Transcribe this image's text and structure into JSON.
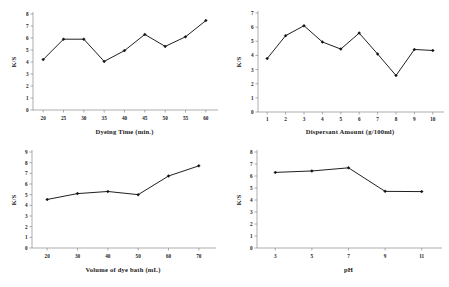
{
  "figure": {
    "name": "four-panel-dyeing-parameter-line-charts",
    "background_color": "#ffffff",
    "line_color": "#141414",
    "marker_color": "#111111",
    "axis_color": "#8a8a8a",
    "text_color": "#1a1a1a"
  },
  "chart_data": [
    {
      "id": "dyeing-time",
      "type": "line",
      "title": "",
      "xlabel": "Dyeing Time (min.)",
      "ylabel": "K/S",
      "x": [
        20,
        25,
        30,
        35,
        40,
        45,
        50,
        55,
        60
      ],
      "values": [
        4.2,
        5.9,
        5.9,
        4.05,
        4.95,
        6.3,
        5.3,
        6.1,
        7.45
      ],
      "xticks": [
        "20",
        "25",
        "30",
        "35",
        "40",
        "45",
        "50",
        "55",
        "60"
      ],
      "yticks": [
        "0",
        "1",
        "2",
        "3",
        "4",
        "5",
        "6",
        "7",
        "8"
      ],
      "xlim": [
        17.5,
        62.5
      ],
      "ylim": [
        0,
        8
      ],
      "grid": false,
      "legend": "none",
      "marker": "diamond"
    },
    {
      "id": "dispersant-amount",
      "type": "line",
      "title": "",
      "xlabel": "Dispersant Amount (g/100ml)",
      "ylabel": "K/S",
      "x": [
        1,
        2,
        3,
        4,
        5,
        6,
        7,
        8,
        9,
        10
      ],
      "values": [
        3.78,
        5.4,
        6.1,
        4.95,
        4.45,
        5.58,
        4.1,
        2.58,
        4.42,
        4.35
      ],
      "xticks": [
        "1",
        "2",
        "3",
        "4",
        "5",
        "6",
        "7",
        "8",
        "9",
        "10"
      ],
      "yticks": [
        "0",
        "1",
        "2",
        "3",
        "4",
        "5",
        "6",
        "7"
      ],
      "xlim": [
        0.5,
        10.5
      ],
      "ylim": [
        0,
        7
      ],
      "grid": false,
      "legend": "none",
      "marker": "diamond"
    },
    {
      "id": "volume-of-dye-bath",
      "type": "line",
      "title": "",
      "xlabel": "Volume  of dye bath  (mL)",
      "ylabel": "K/S",
      "x": [
        20,
        30,
        40,
        50,
        60,
        70
      ],
      "values": [
        4.55,
        5.1,
        5.3,
        5.0,
        6.75,
        7.7
      ],
      "xticks": [
        "20",
        "30",
        "40",
        "50",
        "60",
        "70"
      ],
      "yticks": [
        "0",
        "1",
        "2",
        "3",
        "4",
        "5",
        "6",
        "7",
        "8",
        "9"
      ],
      "xlim": [
        15,
        75
      ],
      "ylim": [
        0,
        9
      ],
      "grid": false,
      "legend": "none",
      "marker": "diamond"
    },
    {
      "id": "ph",
      "type": "line",
      "title": "",
      "xlabel": "pH",
      "ylabel": "K/S",
      "x": [
        3,
        5,
        7,
        9,
        11
      ],
      "values": [
        6.3,
        6.42,
        6.68,
        4.72,
        4.7
      ],
      "xticks": [
        "3",
        "5",
        "7",
        "9",
        "11"
      ],
      "yticks": [
        "0",
        "1",
        "2",
        "3",
        "4",
        "5",
        "6",
        "7",
        "8"
      ],
      "xlim": [
        2,
        12
      ],
      "ylim": [
        0,
        8
      ],
      "grid": false,
      "legend": "none",
      "marker": "diamond"
    }
  ]
}
